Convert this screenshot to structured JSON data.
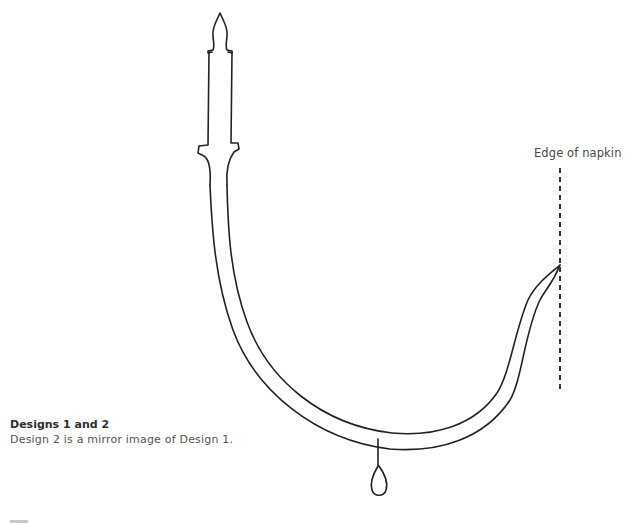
{
  "figure": {
    "edge_label": "Edge of napkin",
    "elements": [
      "candle-with-flame",
      "curved-candlestick-arm",
      "drip-loop",
      "napkin-edge-dashed-line"
    ]
  },
  "caption": {
    "title": "Designs 1 and 2",
    "body": "Design 2 is a mirror image of Design 1."
  },
  "colors": {
    "line": "#222222",
    "background": "#ffffff",
    "text": "#4a4a4a"
  }
}
